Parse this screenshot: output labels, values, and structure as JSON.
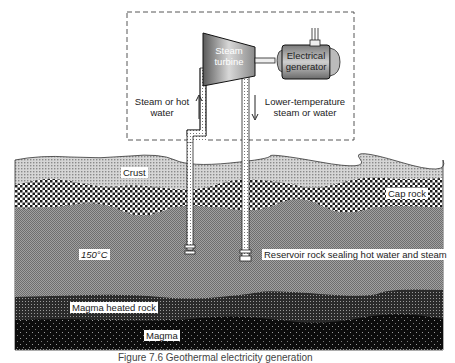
{
  "diagram": {
    "surface_plant": {
      "turbine_label_line1": "Steam",
      "turbine_label_line2": "turbine",
      "generator_label_line1": "Electrical",
      "generator_label_line2": "generator",
      "up_flow_label_line1": "Steam or hot",
      "up_flow_label_line2": "water",
      "down_flow_label_line1": "Lower-temperature",
      "down_flow_label_line2": "steam or water"
    },
    "layers": [
      {
        "name": "Crust",
        "color": "#c9c9c9"
      },
      {
        "name": "Cap rock",
        "color": "#8a8a8a"
      },
      {
        "name": "Reservoir rock sealing hot water and steam",
        "color": "#8f8f8f"
      },
      {
        "name": "Magma heated rock",
        "color": "#2e2e2e"
      },
      {
        "name": "Magma",
        "color": "#111111"
      }
    ],
    "temperature_label": "150°C",
    "caption": "Figure 7.6   Geothermal electricity generation"
  }
}
